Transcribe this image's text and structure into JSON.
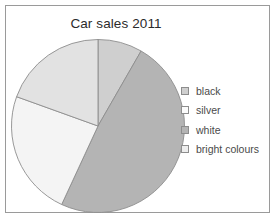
{
  "chart_data": {
    "type": "pie",
    "title": "Car sales 2011",
    "categories": [
      "black",
      "silver",
      "white",
      "bright colours"
    ],
    "values": [
      8.3,
      48.6,
      23.6,
      19.5
    ],
    "units": "percent",
    "start_angle": 0,
    "direction": "clockwise",
    "slice_colors": [
      "#cfcfcf",
      "#b4b4b4",
      "#f4f4f4",
      "#e2e2e2"
    ],
    "slice_outline": "#8d8d8d",
    "legend_position": "right",
    "legend_swatch_colors": [
      "#cfcfcf",
      "#fbfbfb",
      "#b4b4b4",
      "#ededed"
    ],
    "grid": false,
    "xlabel": "",
    "ylabel": ""
  },
  "figure": {
    "border_color": "#9a9a9a",
    "background": "#ffffff",
    "title_color": "#2b2b2b",
    "legend_text_color": "#4a4a4a"
  },
  "legend": {
    "items": [
      {
        "label": "black"
      },
      {
        "label": "silver"
      },
      {
        "label": "white"
      },
      {
        "label": "bright colours"
      }
    ]
  }
}
